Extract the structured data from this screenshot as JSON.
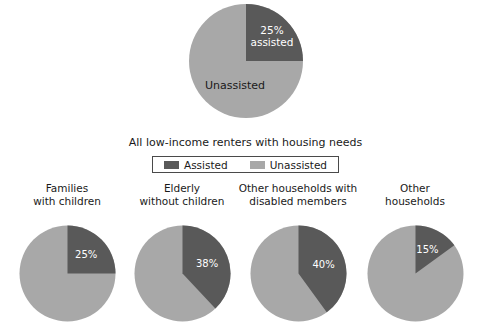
{
  "colors": {
    "assisted": "#595959",
    "unassisted": "#a8a8a8",
    "background": "#ffffff",
    "text": "#1a1a1a",
    "slice_label_text": "#ffffff",
    "legend_border": "#4a4a4a"
  },
  "hero": {
    "assisted_label": "25%\nassisted",
    "unassisted_label": "Unassisted",
    "assisted_value": 25,
    "unassisted_value": 75
  },
  "caption": "All low-income renters with housing needs",
  "legend": {
    "items": [
      {
        "label": "Assisted",
        "color": "#595959"
      },
      {
        "label": "Unassisted",
        "color": "#a8a8a8"
      }
    ]
  },
  "small_charts": [
    {
      "title": "Families\nwith children",
      "assisted": 25,
      "unassisted": 75,
      "value_label": "25%"
    },
    {
      "title": "Elderly\nwithout children",
      "assisted": 38,
      "unassisted": 62,
      "value_label": "38%"
    },
    {
      "title": "Other households with\ndisabled members",
      "assisted": 40,
      "unassisted": 60,
      "value_label": "40%"
    },
    {
      "title": "Other\nhouseholds",
      "assisted": 15,
      "unassisted": 85,
      "value_label": "15%"
    }
  ],
  "chart_data": {
    "type": "pie",
    "title": "All low-income renters with housing needs",
    "legend": [
      "Assisted",
      "Unassisted"
    ],
    "legend_position": "below-title",
    "charts": [
      {
        "name": "All low-income renters with housing needs",
        "categories": [
          "Assisted",
          "Unassisted"
        ],
        "values": [
          25,
          75
        ],
        "labels": [
          "25% assisted",
          "Unassisted"
        ],
        "units": "percent"
      },
      {
        "name": "Families with children",
        "categories": [
          "Assisted",
          "Unassisted"
        ],
        "values": [
          25,
          75
        ],
        "labels": [
          "25%",
          ""
        ],
        "units": "percent"
      },
      {
        "name": "Elderly without children",
        "categories": [
          "Assisted",
          "Unassisted"
        ],
        "values": [
          38,
          62
        ],
        "labels": [
          "38%",
          ""
        ],
        "units": "percent"
      },
      {
        "name": "Other households with disabled members",
        "categories": [
          "Assisted",
          "Unassisted"
        ],
        "values": [
          40,
          60
        ],
        "labels": [
          "40%",
          ""
        ],
        "units": "percent"
      },
      {
        "name": "Other households",
        "categories": [
          "Assisted",
          "Unassisted"
        ],
        "values": [
          15,
          85
        ],
        "labels": [
          "15%",
          ""
        ],
        "units": "percent"
      }
    ]
  }
}
